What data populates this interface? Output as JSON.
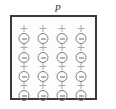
{
  "figure": {
    "label": "p",
    "label_name": "polarization-vector-label",
    "box": {
      "fill_color": "#fdfdfd",
      "border_color": "#3a3a3a",
      "border_width_px": 2,
      "x": 10,
      "y": 15,
      "width": 87,
      "height": 85
    },
    "background_color": "#ffffff",
    "grid": {
      "rows": 4,
      "columns": 4,
      "count": 16,
      "column_x": [
        22,
        41,
        60,
        79
      ],
      "row_y": [
        33,
        52,
        71,
        90
      ]
    },
    "dipole": {
      "positive_symbol": "+",
      "negative_symbol": "−",
      "circle_stroke_color": "#7d7d7d",
      "symbol_color": "#a9a9a9",
      "description": "circle containing a minus sign with a plus sign above it"
    },
    "dipoles": [
      {
        "row": 1,
        "col": 1,
        "plus": "+",
        "minus": "−"
      },
      {
        "row": 1,
        "col": 2,
        "plus": "+",
        "minus": "−"
      },
      {
        "row": 1,
        "col": 3,
        "plus": "+",
        "minus": "−"
      },
      {
        "row": 1,
        "col": 4,
        "plus": "+",
        "minus": "−"
      },
      {
        "row": 2,
        "col": 1,
        "plus": "+",
        "minus": "−"
      },
      {
        "row": 2,
        "col": 2,
        "plus": "+",
        "minus": "−"
      },
      {
        "row": 2,
        "col": 3,
        "plus": "+",
        "minus": "−"
      },
      {
        "row": 2,
        "col": 4,
        "plus": "+",
        "minus": "−"
      },
      {
        "row": 3,
        "col": 1,
        "plus": "+",
        "minus": "−"
      },
      {
        "row": 3,
        "col": 2,
        "plus": "+",
        "minus": "−"
      },
      {
        "row": 3,
        "col": 3,
        "plus": "+",
        "minus": "−"
      },
      {
        "row": 3,
        "col": 4,
        "plus": "+",
        "minus": "−"
      },
      {
        "row": 4,
        "col": 1,
        "plus": "+",
        "minus": "−"
      },
      {
        "row": 4,
        "col": 2,
        "plus": "+",
        "minus": "−"
      },
      {
        "row": 4,
        "col": 3,
        "plus": "+",
        "minus": "−"
      },
      {
        "row": 4,
        "col": 4,
        "plus": "+",
        "minus": "−"
      }
    ]
  }
}
